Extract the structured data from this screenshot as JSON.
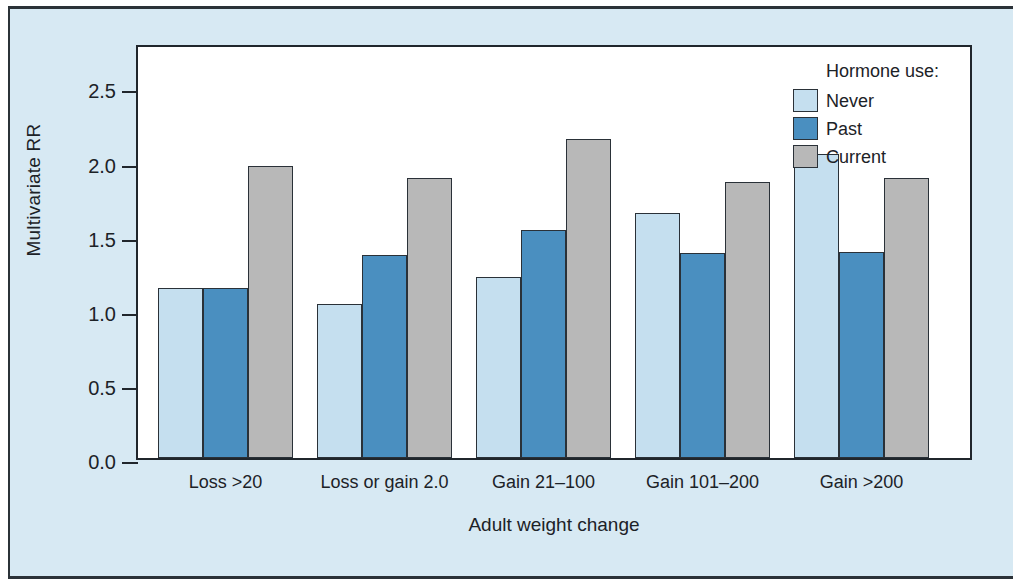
{
  "chart_data": {
    "type": "bar",
    "title": "",
    "xlabel": "Adult weight change",
    "ylabel": "Multivariate RR",
    "categories": [
      "Loss >20",
      "Loss or gain 2.0",
      "Gain 21–100",
      "Gain 101–200",
      "Gain >200"
    ],
    "series": [
      {
        "name": "Never",
        "color": "#c5dfef",
        "values": [
          1.15,
          1.04,
          1.22,
          1.65,
          2.05
        ]
      },
      {
        "name": "Past",
        "color": "#4a8fc0",
        "values": [
          1.15,
          1.37,
          1.54,
          1.38,
          1.39
        ]
      },
      {
        "name": "Current",
        "color": "#b8b8b8",
        "values": [
          1.97,
          1.89,
          2.15,
          1.86,
          1.89
        ]
      }
    ],
    "ylim": [
      0.0,
      2.8
    ],
    "yticks": [
      0.0,
      0.5,
      1.0,
      1.5,
      2.0,
      2.5
    ],
    "ytick_labels": [
      "0.0",
      "0.5",
      "1.0",
      "1.5",
      "2.0",
      "2.5"
    ],
    "grid": false,
    "legend": {
      "title": "Hormone use:",
      "position": "top-right",
      "entries": [
        "Never",
        "Past",
        "Current"
      ]
    }
  },
  "legend": {
    "title": "Hormone use:",
    "entries": [
      {
        "label": "Never",
        "swatch": "never"
      },
      {
        "label": "Past",
        "swatch": "past"
      },
      {
        "label": "Current",
        "swatch": "current"
      }
    ]
  },
  "axes": {
    "y_title": "Multivariate RR",
    "x_title": "Adult weight change"
  },
  "colors": {
    "panel_background": "#d7e9f3",
    "plot_background": "#ffffff",
    "border": "#20262c",
    "never": "#c5dfef",
    "past": "#4a8fc0",
    "current": "#b8b8b8"
  }
}
